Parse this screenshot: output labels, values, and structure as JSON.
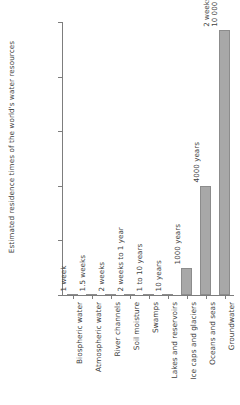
{
  "chart_data": {
    "type": "bar",
    "title": "",
    "xlabel": "",
    "ylabel": "Estimated residence times of the world's water resources",
    "ylim": [
      0,
      10000
    ],
    "yticks": [
      0,
      2000,
      4000,
      6000,
      8000,
      10000
    ],
    "ytick_labels": [
      "0",
      "2000",
      "4000",
      "6000",
      "8000",
      "10 000"
    ],
    "grid": false,
    "legend": false,
    "categories": [
      "Biospheric water",
      "Atmospheric water",
      "River channels",
      "Soil moisture",
      "Swamps",
      "Lakes and reservoirs",
      "Ice caps and glaciers",
      "Oceans and seas",
      "Groundwater"
    ],
    "values": [
      0.02,
      0.03,
      0.04,
      0.5,
      5,
      10,
      1000,
      4000,
      9700
    ],
    "data_labels": [
      "1 week",
      "1.5 weeks",
      "2 weeks",
      "2 weeks to 1 year",
      "1 to 10 years",
      "10 years",
      "1000 years",
      "4000 years",
      "2 weeks to\n10 000 years"
    ],
    "bar_color": "#a8a8a8",
    "bar_edge_color": "#8c8c8c",
    "axis_color": "#7d7d7d",
    "text_color": "#3f3f3f",
    "background": "#ffffff"
  }
}
